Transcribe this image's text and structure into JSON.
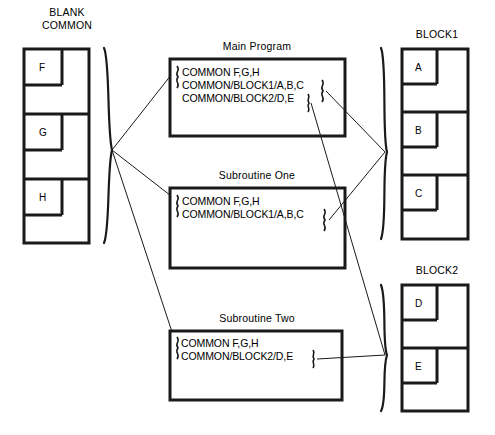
{
  "diagram": {
    "type": "fortran-common-block-memory-map",
    "accent_color": "#1a1a1a",
    "background_color": "#ffffff"
  },
  "blank_common": {
    "title_line1": "BLANK",
    "title_line2": "COMMON",
    "cells": [
      "F",
      "G",
      "H"
    ]
  },
  "blocks": [
    {
      "title": "BLOCK1",
      "cells": [
        "A",
        "B",
        "C"
      ]
    },
    {
      "title": "BLOCK2",
      "cells": [
        "D",
        "E"
      ]
    }
  ],
  "programs": [
    {
      "title": "Main Program",
      "lines": [
        "COMMON F,G,H",
        "COMMON/BLOCK1/A,B,C",
        "COMMON/BLOCK2/D,E"
      ]
    },
    {
      "title": "Subroutine One",
      "lines": [
        "COMMON F,G,H",
        "COMMON/BLOCK1/A,B,C"
      ]
    },
    {
      "title": "Subroutine Two",
      "lines": [
        "COMMON F,G,H",
        "COMMON/BLOCK2/D,E"
      ]
    }
  ]
}
